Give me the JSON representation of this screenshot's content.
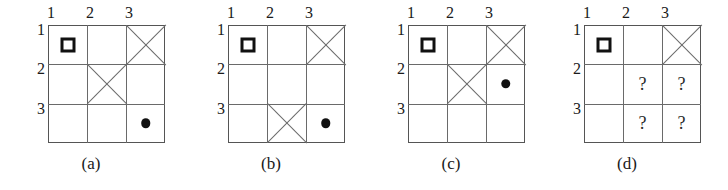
{
  "figure": {
    "background": "#ffffff",
    "line_color": "#6a6a6a",
    "border_color": "#555555",
    "marker_color": "#111111",
    "column_headers": [
      "1",
      "2",
      "3"
    ],
    "row_headers": [
      "1",
      "2",
      "3"
    ],
    "panels": [
      {
        "id": "a",
        "caption": "(a)",
        "left": 0,
        "cells": [
          {
            "row": 1,
            "col": 1,
            "marker": "square",
            "symbol": "□"
          },
          {
            "row": 1,
            "col": 2,
            "marker": "empty",
            "symbol": ""
          },
          {
            "row": 1,
            "col": 3,
            "marker": "cross",
            "symbol": "✕"
          },
          {
            "row": 2,
            "col": 1,
            "marker": "empty",
            "symbol": ""
          },
          {
            "row": 2,
            "col": 2,
            "marker": "cross",
            "symbol": "✕"
          },
          {
            "row": 2,
            "col": 3,
            "marker": "empty",
            "symbol": ""
          },
          {
            "row": 3,
            "col": 1,
            "marker": "empty",
            "symbol": ""
          },
          {
            "row": 3,
            "col": 2,
            "marker": "empty",
            "symbol": ""
          },
          {
            "row": 3,
            "col": 3,
            "marker": "dot",
            "symbol": "●"
          }
        ]
      },
      {
        "id": "b",
        "caption": "(b)",
        "left": 180,
        "cells": [
          {
            "row": 1,
            "col": 1,
            "marker": "square",
            "symbol": "□"
          },
          {
            "row": 1,
            "col": 2,
            "marker": "empty",
            "symbol": ""
          },
          {
            "row": 1,
            "col": 3,
            "marker": "cross",
            "symbol": "✕"
          },
          {
            "row": 2,
            "col": 1,
            "marker": "empty",
            "symbol": ""
          },
          {
            "row": 2,
            "col": 2,
            "marker": "empty",
            "symbol": ""
          },
          {
            "row": 2,
            "col": 3,
            "marker": "empty",
            "symbol": ""
          },
          {
            "row": 3,
            "col": 1,
            "marker": "empty",
            "symbol": ""
          },
          {
            "row": 3,
            "col": 2,
            "marker": "cross",
            "symbol": "✕"
          },
          {
            "row": 3,
            "col": 3,
            "marker": "dot",
            "symbol": "●"
          }
        ]
      },
      {
        "id": "c",
        "caption": "(c)",
        "left": 360,
        "cells": [
          {
            "row": 1,
            "col": 1,
            "marker": "square",
            "symbol": "□"
          },
          {
            "row": 1,
            "col": 2,
            "marker": "empty",
            "symbol": ""
          },
          {
            "row": 1,
            "col": 3,
            "marker": "cross",
            "symbol": "✕"
          },
          {
            "row": 2,
            "col": 1,
            "marker": "empty",
            "symbol": ""
          },
          {
            "row": 2,
            "col": 2,
            "marker": "cross",
            "symbol": "✕"
          },
          {
            "row": 2,
            "col": 3,
            "marker": "dot",
            "symbol": "●"
          },
          {
            "row": 3,
            "col": 1,
            "marker": "empty",
            "symbol": ""
          },
          {
            "row": 3,
            "col": 2,
            "marker": "empty",
            "symbol": ""
          },
          {
            "row": 3,
            "col": 3,
            "marker": "empty",
            "symbol": ""
          }
        ]
      },
      {
        "id": "d",
        "caption": "(d)",
        "left": 536,
        "cells": [
          {
            "row": 1,
            "col": 1,
            "marker": "square",
            "symbol": "□"
          },
          {
            "row": 1,
            "col": 2,
            "marker": "empty",
            "symbol": ""
          },
          {
            "row": 1,
            "col": 3,
            "marker": "cross",
            "symbol": "✕"
          },
          {
            "row": 2,
            "col": 1,
            "marker": "empty",
            "symbol": ""
          },
          {
            "row": 2,
            "col": 2,
            "marker": "question",
            "symbol": "?"
          },
          {
            "row": 2,
            "col": 3,
            "marker": "question",
            "symbol": "?"
          },
          {
            "row": 3,
            "col": 1,
            "marker": "empty",
            "symbol": ""
          },
          {
            "row": 3,
            "col": 2,
            "marker": "question",
            "symbol": "?"
          },
          {
            "row": 3,
            "col": 3,
            "marker": "question",
            "symbol": "?"
          }
        ]
      }
    ]
  }
}
